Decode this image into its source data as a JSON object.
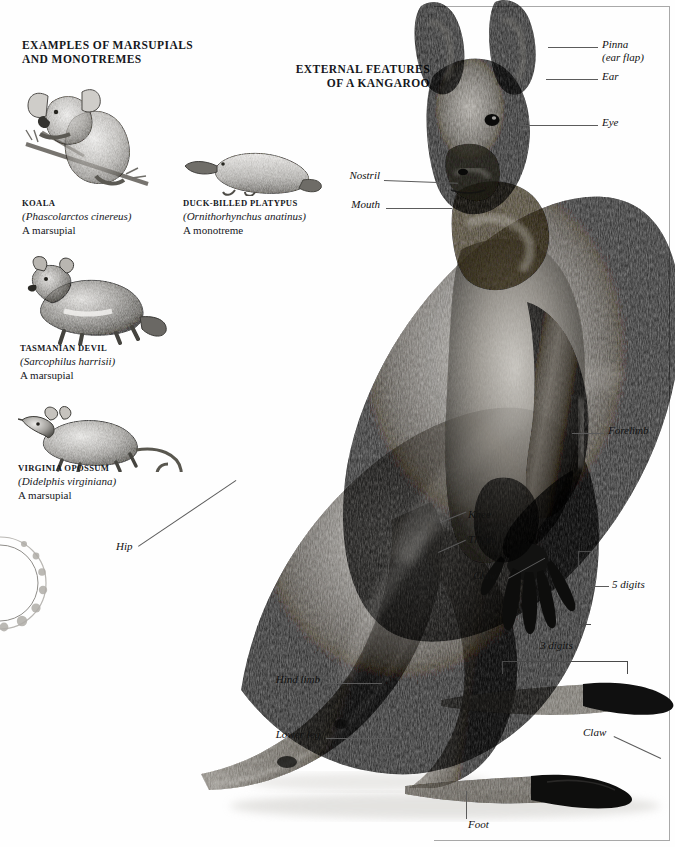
{
  "page": {
    "left_heading": "EXAMPLES OF MARSUPIALS AND MONOTREMES",
    "left_heading_line1": "EXAMPLES OF MARSUPIALS",
    "left_heading_line2": "AND MONOTREMES",
    "right_heading_line1": "EXTERNAL FEATURES",
    "right_heading_line2": "OF A KANGAROO",
    "ink_color": "#15171c",
    "leader_color": "#5b5b5b",
    "background": "#fefefe"
  },
  "specimens": [
    {
      "common_name": "KOALA",
      "scientific_name": "(Phascolarctos cinereus)",
      "group": "A marsupial",
      "figure": "koala-illustration"
    },
    {
      "common_name": "DUCK-BILLED PLATYPUS",
      "scientific_name": "(Ornithorhynchus anatinus)",
      "group": "A monotreme",
      "figure": "platypus-illustration"
    },
    {
      "common_name": "TASMANIAN DEVIL",
      "scientific_name": "(Sarcophilus harrisii)",
      "group": "A marsupial",
      "figure": "tasmanian-devil-illustration"
    },
    {
      "common_name": "VIRGINIA OPOSSUM",
      "scientific_name": "(Didelphis virginiana)",
      "group": "A marsupial",
      "figure": "virginia-opossum-illustration"
    }
  ],
  "kangaroo_labels": [
    {
      "id": "pinna",
      "text_line1": "Pinna",
      "text_line2": "(ear flap)"
    },
    {
      "id": "ear",
      "text_line1": "Ear",
      "text_line2": ""
    },
    {
      "id": "eye",
      "text_line1": "Eye",
      "text_line2": ""
    },
    {
      "id": "nostril",
      "text_line1": "Nostril",
      "text_line2": ""
    },
    {
      "id": "mouth",
      "text_line1": "Mouth",
      "text_line2": ""
    },
    {
      "id": "forelimb",
      "text_line1": "Forelimb",
      "text_line2": ""
    },
    {
      "id": "knee",
      "text_line1": "Knee",
      "text_line2": ""
    },
    {
      "id": "thigh",
      "text_line1": "Thigh",
      "text_line2": ""
    },
    {
      "id": "claw-hand",
      "text_line1": "Claw",
      "text_line2": ""
    },
    {
      "id": "five-digits",
      "text_line1": "5 digits",
      "text_line2": ""
    },
    {
      "id": "three-digits",
      "text_line1": "3 digits",
      "text_line2": ""
    },
    {
      "id": "hip",
      "text_line1": "Hip",
      "text_line2": ""
    },
    {
      "id": "hind-limb",
      "text_line1": "Hind limb",
      "text_line2": ""
    },
    {
      "id": "lower-leg",
      "text_line1": "Lower leg",
      "text_line2": ""
    },
    {
      "id": "claw-foot",
      "text_line1": "Claw",
      "text_line2": ""
    },
    {
      "id": "foot",
      "text_line1": "Foot",
      "text_line2": ""
    }
  ],
  "figure_alt": {
    "kangaroo": "kangaroo-photograph"
  }
}
